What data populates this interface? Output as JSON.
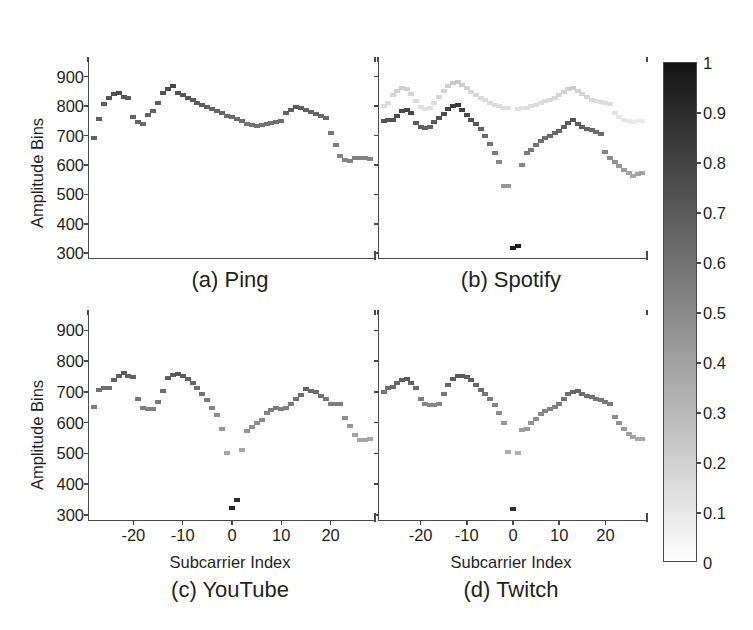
{
  "figure": {
    "xlabel": "Subcarrier Index",
    "ylabel": "Amplitude Bins"
  },
  "colorbar": {
    "name": "intensity-colorbar",
    "ticks": [
      "1",
      "0.9",
      "0.8",
      "0.7",
      "0.6",
      "0.5",
      "0.4",
      "0.3",
      "0.2",
      "0.1",
      "0"
    ],
    "tick_values": [
      1,
      0.9,
      0.8,
      0.7,
      0.6,
      0.5,
      0.4,
      0.3,
      0.2,
      0.1,
      0
    ],
    "min": 0,
    "max": 1,
    "high_color": "#141414",
    "low_color": "#ffffff"
  },
  "axes": {
    "yticks": [
      "900",
      "800",
      "700",
      "600",
      "500",
      "400",
      "300"
    ],
    "ytick_values": [
      900,
      800,
      700,
      600,
      500,
      400,
      300
    ],
    "ylim": [
      280,
      950
    ],
    "xticks": [
      "-20",
      "-10",
      "0",
      "10",
      "20"
    ],
    "xtick_values": [
      -20,
      -10,
      0,
      10,
      20
    ],
    "xlim": [
      -29,
      29
    ]
  },
  "chart_data": [
    {
      "type": "scatter",
      "name": "ping-panel",
      "title": "(a) Ping",
      "xlabel": "Subcarrier Index",
      "ylabel": "Amplitude Bins",
      "xlim": [
        -29,
        29
      ],
      "ylim": [
        280,
        950
      ],
      "grid": false,
      "colormap": "gray-inverted",
      "series": [
        {
          "name": "density",
          "x": [
            -28,
            -27,
            -26,
            -25,
            -24,
            -23,
            -22,
            -21,
            -20,
            -19,
            -18,
            -17,
            -16,
            -15,
            -14,
            -13,
            -12,
            -11,
            -10,
            -9,
            -8,
            -7,
            -6,
            -5,
            -4,
            -3,
            -2,
            -1,
            0,
            1,
            2,
            3,
            4,
            5,
            6,
            7,
            8,
            9,
            10,
            11,
            12,
            13,
            14,
            15,
            16,
            17,
            18,
            19,
            20,
            21,
            22,
            23,
            24,
            25,
            26,
            27,
            28
          ],
          "y": [
            692,
            757,
            808,
            829,
            840,
            845,
            832,
            828,
            762,
            745,
            738,
            770,
            785,
            812,
            845,
            857,
            868,
            843,
            838,
            828,
            820,
            812,
            805,
            798,
            790,
            783,
            775,
            768,
            762,
            757,
            748,
            740,
            735,
            733,
            736,
            740,
            742,
            745,
            748,
            778,
            788,
            798,
            795,
            788,
            780,
            772,
            765,
            758,
            708,
            667,
            630,
            618,
            615,
            622,
            625,
            622,
            620
          ],
          "intensity": [
            0.66,
            0.68,
            0.7,
            0.72,
            0.74,
            0.75,
            0.72,
            0.7,
            0.66,
            0.65,
            0.64,
            0.66,
            0.67,
            0.7,
            0.74,
            0.76,
            0.78,
            0.73,
            0.72,
            0.71,
            0.7,
            0.69,
            0.68,
            0.67,
            0.66,
            0.65,
            0.64,
            0.63,
            0.62,
            0.62,
            0.61,
            0.6,
            0.6,
            0.6,
            0.6,
            0.61,
            0.61,
            0.62,
            0.62,
            0.66,
            0.68,
            0.7,
            0.69,
            0.67,
            0.66,
            0.65,
            0.64,
            0.63,
            0.58,
            0.55,
            0.52,
            0.52,
            0.52,
            0.53,
            0.53,
            0.53,
            0.52
          ]
        }
      ]
    },
    {
      "type": "scatter",
      "name": "spotify-panel",
      "title": "(b) Spotify",
      "xlabel": "Subcarrier Index",
      "ylabel": "Amplitude Bins",
      "xlim": [
        -29,
        29
      ],
      "ylim": [
        280,
        950
      ],
      "grid": false,
      "colormap": "gray-inverted",
      "series": [
        {
          "name": "primary-dark-band",
          "x": [
            -28,
            -27,
            -26,
            -25,
            -24,
            -23,
            -22,
            -21,
            -20,
            -19,
            -18,
            -17,
            -16,
            -15,
            -14,
            -13,
            -12,
            -11,
            -10,
            -9,
            -8,
            -7,
            -6,
            -5,
            -4,
            -3,
            -2,
            -1,
            0,
            1,
            2,
            3,
            4,
            5,
            6,
            7,
            8,
            9,
            10,
            11,
            12,
            13,
            14,
            15,
            16,
            17,
            18,
            19,
            20,
            21,
            22,
            23,
            24,
            25,
            26,
            27,
            28
          ],
          "y": [
            748,
            752,
            752,
            768,
            782,
            788,
            778,
            742,
            728,
            725,
            728,
            745,
            760,
            772,
            790,
            800,
            805,
            788,
            770,
            752,
            738,
            722,
            700,
            672,
            642,
            610,
            528,
            528,
            318,
            325,
            598,
            640,
            652,
            668,
            682,
            690,
            700,
            708,
            715,
            728,
            742,
            752,
            738,
            728,
            722,
            718,
            712,
            705,
            645,
            622,
            610,
            595,
            582,
            572,
            562,
            568,
            572
          ],
          "intensity": [
            0.72,
            0.74,
            0.74,
            0.76,
            0.78,
            0.79,
            0.77,
            0.7,
            0.68,
            0.67,
            0.68,
            0.71,
            0.74,
            0.76,
            0.8,
            0.82,
            0.84,
            0.8,
            0.76,
            0.73,
            0.7,
            0.67,
            0.64,
            0.6,
            0.56,
            0.52,
            0.44,
            0.44,
            0.95,
            0.96,
            0.52,
            0.55,
            0.57,
            0.59,
            0.61,
            0.62,
            0.63,
            0.64,
            0.65,
            0.67,
            0.7,
            0.72,
            0.69,
            0.67,
            0.66,
            0.65,
            0.64,
            0.62,
            0.52,
            0.48,
            0.46,
            0.44,
            0.42,
            0.4,
            0.38,
            0.39,
            0.4
          ]
        },
        {
          "name": "secondary-light-band",
          "x": [
            -28,
            -27,
            -26,
            -25,
            -24,
            -23,
            -22,
            -21,
            -20,
            -19,
            -18,
            -17,
            -16,
            -15,
            -14,
            -13,
            -12,
            -11,
            -10,
            -9,
            -8,
            -7,
            -6,
            -5,
            -4,
            -3,
            -2,
            -1,
            1,
            2,
            3,
            4,
            5,
            6,
            7,
            8,
            9,
            10,
            11,
            12,
            13,
            14,
            15,
            16,
            17,
            18,
            19,
            20,
            21,
            22,
            23,
            24,
            25,
            26,
            27,
            28
          ],
          "y": [
            800,
            812,
            838,
            852,
            862,
            858,
            840,
            818,
            798,
            790,
            795,
            812,
            832,
            852,
            868,
            878,
            882,
            872,
            860,
            848,
            838,
            828,
            820,
            812,
            805,
            800,
            795,
            792,
            790,
            792,
            795,
            800,
            805,
            812,
            818,
            822,
            828,
            838,
            848,
            858,
            862,
            852,
            842,
            832,
            822,
            818,
            815,
            812,
            808,
            778,
            762,
            752,
            748,
            745,
            748,
            750
          ],
          "intensity": [
            0.14,
            0.15,
            0.17,
            0.19,
            0.2,
            0.19,
            0.17,
            0.15,
            0.13,
            0.13,
            0.13,
            0.15,
            0.17,
            0.19,
            0.21,
            0.22,
            0.23,
            0.21,
            0.19,
            0.18,
            0.17,
            0.16,
            0.15,
            0.15,
            0.14,
            0.14,
            0.13,
            0.13,
            0.13,
            0.13,
            0.14,
            0.14,
            0.15,
            0.15,
            0.16,
            0.16,
            0.17,
            0.18,
            0.19,
            0.2,
            0.21,
            0.19,
            0.18,
            0.17,
            0.16,
            0.15,
            0.15,
            0.15,
            0.14,
            0.12,
            0.11,
            0.11,
            0.1,
            0.1,
            0.1,
            0.1
          ]
        }
      ]
    },
    {
      "type": "scatter",
      "name": "youtube-panel",
      "title": "(c) YouTube",
      "xlabel": "Subcarrier Index",
      "ylabel": "Amplitude Bins",
      "xlim": [
        -29,
        29
      ],
      "ylim": [
        280,
        950
      ],
      "grid": false,
      "colormap": "gray-inverted",
      "series": [
        {
          "name": "density",
          "x": [
            -28,
            -27,
            -26,
            -25,
            -24,
            -23,
            -22,
            -21,
            -20,
            -19,
            -18,
            -17,
            -16,
            -15,
            -14,
            -13,
            -12,
            -11,
            -10,
            -9,
            -8,
            -7,
            -6,
            -5,
            -4,
            -3,
            -2,
            -1,
            0,
            1,
            2,
            3,
            4,
            5,
            6,
            7,
            8,
            9,
            10,
            11,
            12,
            13,
            14,
            15,
            16,
            17,
            18,
            19,
            20,
            21,
            22,
            23,
            24,
            25,
            26,
            27,
            28
          ],
          "y": [
            650,
            705,
            712,
            712,
            738,
            750,
            762,
            752,
            748,
            678,
            648,
            645,
            645,
            668,
            702,
            745,
            755,
            758,
            752,
            742,
            728,
            712,
            692,
            672,
            648,
            625,
            580,
            502,
            322,
            348,
            512,
            572,
            585,
            598,
            608,
            630,
            640,
            648,
            645,
            648,
            662,
            678,
            690,
            710,
            702,
            698,
            688,
            678,
            662,
            662,
            662,
            615,
            588,
            560,
            545,
            545,
            548
          ],
          "intensity": [
            0.55,
            0.6,
            0.62,
            0.62,
            0.66,
            0.68,
            0.7,
            0.68,
            0.67,
            0.58,
            0.54,
            0.53,
            0.53,
            0.57,
            0.62,
            0.68,
            0.7,
            0.71,
            0.7,
            0.68,
            0.65,
            0.62,
            0.59,
            0.56,
            0.52,
            0.49,
            0.44,
            0.38,
            0.92,
            0.9,
            0.38,
            0.45,
            0.46,
            0.48,
            0.49,
            0.52,
            0.54,
            0.55,
            0.54,
            0.55,
            0.57,
            0.6,
            0.62,
            0.65,
            0.63,
            0.62,
            0.6,
            0.58,
            0.55,
            0.55,
            0.55,
            0.48,
            0.44,
            0.4,
            0.38,
            0.38,
            0.38
          ]
        }
      ]
    },
    {
      "type": "scatter",
      "name": "twitch-panel",
      "title": "(d) Twitch",
      "xlabel": "Subcarrier Index",
      "ylabel": "Amplitude Bins",
      "xlim": [
        -29,
        29
      ],
      "ylim": [
        280,
        950
      ],
      "grid": false,
      "colormap": "gray-inverted",
      "series": [
        {
          "name": "density",
          "x": [
            -28,
            -27,
            -26,
            -25,
            -24,
            -23,
            -22,
            -21,
            -20,
            -19,
            -18,
            -17,
            -16,
            -15,
            -14,
            -13,
            -12,
            -11,
            -10,
            -9,
            -8,
            -7,
            -6,
            -5,
            -4,
            -3,
            -2,
            -1,
            0,
            1,
            2,
            3,
            4,
            5,
            6,
            7,
            8,
            9,
            10,
            11,
            12,
            13,
            14,
            15,
            16,
            17,
            18,
            19,
            20,
            21,
            22,
            23,
            24,
            25,
            26,
            27,
            28
          ],
          "y": [
            700,
            712,
            715,
            728,
            738,
            742,
            728,
            712,
            678,
            662,
            658,
            658,
            662,
            692,
            722,
            742,
            752,
            752,
            748,
            738,
            722,
            705,
            692,
            678,
            658,
            632,
            598,
            505,
            318,
            502,
            575,
            578,
            598,
            612,
            628,
            638,
            645,
            650,
            662,
            678,
            692,
            700,
            702,
            692,
            688,
            682,
            678,
            672,
            668,
            662,
            618,
            598,
            578,
            562,
            552,
            548,
            548
          ],
          "intensity": [
            0.58,
            0.62,
            0.63,
            0.66,
            0.68,
            0.69,
            0.66,
            0.62,
            0.55,
            0.52,
            0.51,
            0.51,
            0.52,
            0.58,
            0.65,
            0.69,
            0.71,
            0.71,
            0.7,
            0.68,
            0.65,
            0.62,
            0.59,
            0.56,
            0.52,
            0.48,
            0.44,
            0.34,
            0.88,
            0.34,
            0.42,
            0.42,
            0.45,
            0.47,
            0.5,
            0.52,
            0.53,
            0.54,
            0.56,
            0.59,
            0.62,
            0.64,
            0.65,
            0.62,
            0.61,
            0.6,
            0.59,
            0.58,
            0.57,
            0.56,
            0.49,
            0.46,
            0.42,
            0.39,
            0.38,
            0.37,
            0.37
          ]
        }
      ]
    }
  ]
}
